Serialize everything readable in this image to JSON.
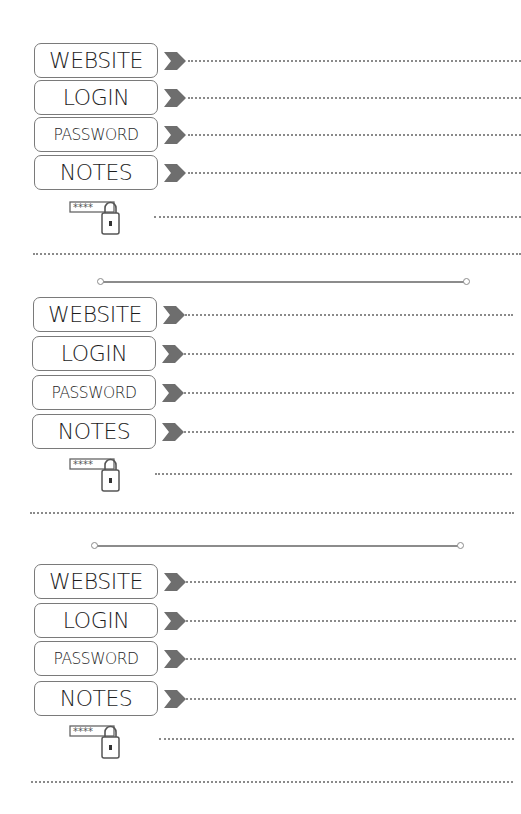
{
  "page": {
    "colors": {
      "box_border": "#7a7a7a",
      "arrow": "#6e6e6e",
      "dots": "#8a8a8a",
      "divider": "#8c8c8c",
      "text": "#1d1d1d"
    }
  },
  "entries": [
    {
      "fields": [
        {
          "label": "WEBSITE",
          "value": ""
        },
        {
          "label": "LOGIN",
          "value": ""
        },
        {
          "label": "PASSWORD",
          "value": ""
        },
        {
          "label": "NOTES",
          "value": ""
        }
      ],
      "icon": "password-lock-icon",
      "icon_text": "****"
    },
    {
      "fields": [
        {
          "label": "WEBSITE",
          "value": ""
        },
        {
          "label": "LOGIN",
          "value": ""
        },
        {
          "label": "PASSWORD",
          "value": ""
        },
        {
          "label": "NOTES",
          "value": ""
        }
      ],
      "icon": "password-lock-icon",
      "icon_text": "****"
    },
    {
      "fields": [
        {
          "label": "WEBSITE",
          "value": ""
        },
        {
          "label": "LOGIN",
          "value": ""
        },
        {
          "label": "PASSWORD",
          "value": ""
        },
        {
          "label": "NOTES",
          "value": ""
        }
      ],
      "icon": "password-lock-icon",
      "icon_text": "****"
    }
  ]
}
